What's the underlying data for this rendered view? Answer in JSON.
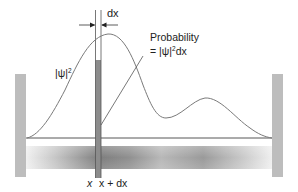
{
  "diagram": {
    "curve_label": {
      "prefix": "|ψ|",
      "exponent": "2"
    },
    "probability_label": {
      "line1": "Probability",
      "line2_prefix": "= |ψ|",
      "line2_exponent": "2",
      "line2_suffix": "dx"
    },
    "width_label": "dx",
    "axis_labels": {
      "x": "x",
      "x_plus_dx": "x + dx"
    },
    "colors": {
      "curve": "#7a7a7a",
      "baseline": "#444444",
      "wall": "#b9b9b9",
      "strip_fill": "#8c8c8c",
      "strip_edges": "#555555",
      "gradient_light": "#eeeeee",
      "gradient_dark": "#7d7d7d",
      "text": "#222222"
    }
  }
}
